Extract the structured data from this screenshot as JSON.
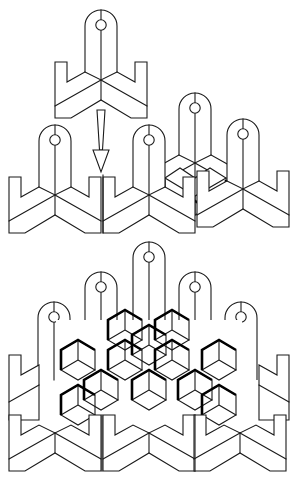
{
  "figure": {
    "title": "Interlocking tab-piece tessellation assembly",
    "colors": {
      "stroke": "#1a1a1a",
      "background": "#ffffff",
      "emphasis": "#000000"
    },
    "stages": [
      {
        "id": "single-piece",
        "label": "Single piece",
        "pieces": [
          {
            "cx": 101,
            "cy": 80
          }
        ]
      },
      {
        "id": "insert-arrow",
        "label": "Insertion arrow",
        "from": [
          101,
          110
        ],
        "to": [
          101,
          172
        ]
      },
      {
        "id": "row-assembly",
        "label": "Partial assembly (row of four)",
        "pieces": [
          {
            "cx": 55,
            "cy": 195
          },
          {
            "cx": 149,
            "cy": 195
          },
          {
            "cx": 195,
            "cy": 163
          },
          {
            "cx": 243,
            "cy": 189
          }
        ]
      },
      {
        "id": "full-assembly",
        "label": "Full tessellated assembly",
        "tabs": [
          {
            "cx": 54,
            "cy": 372
          },
          {
            "cx": 101,
            "cy": 342
          },
          {
            "cx": 149,
            "cy": 312
          },
          {
            "cx": 195,
            "cy": 342
          },
          {
            "cx": 241,
            "cy": 372
          }
        ],
        "bottom_row": [
          {
            "cx": 55,
            "cy": 433
          },
          {
            "cx": 149,
            "cy": 433
          },
          {
            "cx": 240,
            "cy": 433
          }
        ]
      }
    ]
  }
}
